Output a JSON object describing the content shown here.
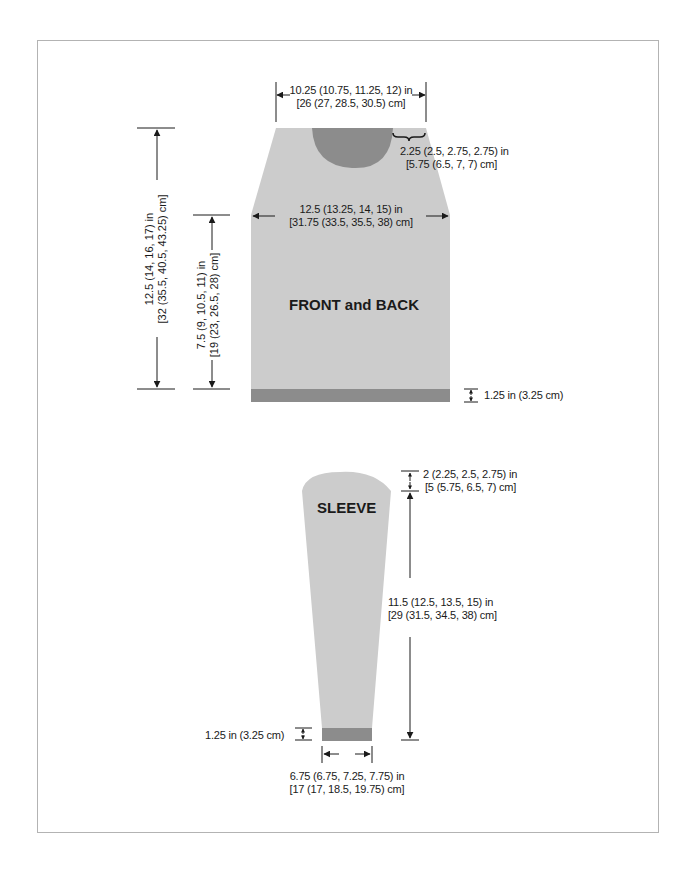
{
  "colors": {
    "garment": "#cccccc",
    "rib": "#8c8c8c",
    "neck": "#8c8c8c",
    "line": "#1a1a1a",
    "frame": "#b3b3b3"
  },
  "front_back": {
    "label": "FRONT and BACK",
    "neck_width": {
      "line1": "10.25 (10.75, 11.25, 12) in",
      "line2": "[26 (27, 28.5, 30.5) cm]"
    },
    "shoulder_width": {
      "line1": "2.25 (2.5, 2.75, 2.75) in",
      "line2": "[5.75 (6.5, 7, 7) cm]"
    },
    "chest_width": {
      "line1": "12.5 (13.25, 14, 15) in",
      "line2": "[31.75 (33.5, 35.5, 38) cm]"
    },
    "total_length": {
      "line1": "12.5 (14, 16, 17) in",
      "line2": "[32 (35.5, 40.5, 43.25) cm]"
    },
    "body_length": {
      "line1": "7.5 (9, 10.5, 11) in",
      "line2": "[19 (23, 26.5, 28) cm]"
    },
    "rib_height": "1.25 in (3.25 cm)"
  },
  "sleeve": {
    "label": "SLEEVE",
    "cap_height": {
      "line1": "2 (2.25, 2.5, 2.75) in",
      "line2": "[5 (5.75, 6.5, 7) cm]"
    },
    "sleeve_length": {
      "line1": "11.5 (12.5, 13.5, 15) in",
      "line2": "[29 (31.5, 34.5, 38) cm]"
    },
    "cuff_width": {
      "line1": "6.75 (6.75, 7.25, 7.75) in",
      "line2": "[17 (17, 18.5, 19.75) cm]"
    },
    "rib_height": "1.25 in (3.25 cm)"
  }
}
